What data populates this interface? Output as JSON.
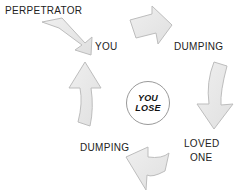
{
  "diagram": {
    "title_text": "",
    "colors": {
      "arrow_fill": "#e8e8e8",
      "arrow_stroke": "#b5b5b5",
      "text": "#222222",
      "circle_stroke": "#9a9a9a",
      "background": "#ffffff"
    },
    "center": {
      "name": "you-lose-node",
      "line1": "YOU",
      "line2": "LOSE"
    },
    "labels": [
      {
        "id": "perpetrator",
        "text": "PERPETRATOR",
        "x": 5,
        "y": 5
      },
      {
        "id": "you",
        "text": "YOU",
        "x": 95,
        "y": 41
      },
      {
        "id": "dumping-top",
        "text": "DUMPING",
        "x": 174,
        "y": 41
      },
      {
        "id": "loved-one-1",
        "text": "LOVED",
        "x": 184,
        "y": 138
      },
      {
        "id": "loved-one-2",
        "text": "ONE",
        "x": 190,
        "y": 152
      },
      {
        "id": "dumping-bottom",
        "text": "DUMPING",
        "x": 80,
        "y": 142
      }
    ],
    "arrows": [
      {
        "id": "arrow-perpetrator-to-you",
        "direction": "down-right"
      },
      {
        "id": "arrow-you-to-dumping",
        "direction": "right-bend-down"
      },
      {
        "id": "arrow-dumping-to-lovedone",
        "direction": "down-curved"
      },
      {
        "id": "arrow-lovedone-to-dumping",
        "direction": "left-bend"
      },
      {
        "id": "arrow-dumping-to-perpetrator",
        "direction": "up-curved"
      }
    ]
  }
}
